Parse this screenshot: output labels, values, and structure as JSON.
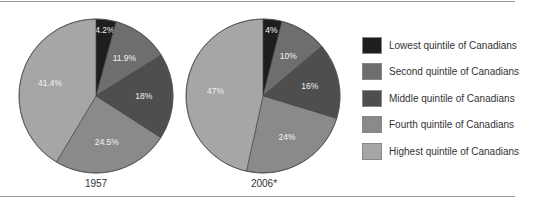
{
  "chart_data": [
    {
      "type": "pie",
      "title": "1957",
      "categories": [
        "Lowest quintile of Canadians",
        "Second quintile of Canadians",
        "Middle quintile of Canadians",
        "Fourth quintile of Canadians",
        "Highest quintile of Canadians"
      ],
      "values": [
        4.2,
        11.9,
        18,
        24.5,
        41.4
      ],
      "labels": [
        "4.2%",
        "11.9%",
        "18%",
        "24.5%",
        "41.4%"
      ]
    },
    {
      "type": "pie",
      "title": "2006*",
      "categories": [
        "Lowest quintile of Canadians",
        "Second quintile of Canadians",
        "Middle quintile of Canadians",
        "Fourth quintile of Canadians",
        "Highest quintile of Canadians"
      ],
      "values": [
        4,
        10,
        16,
        24,
        47
      ],
      "labels": [
        "4%",
        "10%",
        "16%",
        "24%",
        "47%"
      ]
    }
  ],
  "colors": [
    "#1e1e1e",
    "#6e6e6e",
    "#4e4e4e",
    "#8a8a8a",
    "#a6a6a6"
  ],
  "pies": {
    "p1_year": "1957",
    "p2_year": "2006*"
  },
  "legend": [
    {
      "label": "Lowest quintile of Canadians"
    },
    {
      "label": "Second quintile of Canadians"
    },
    {
      "label": "Middle quintile of Canadians"
    },
    {
      "label": "Fourth quintile of Canadians"
    },
    {
      "label": "Highest quintile of Canadians"
    }
  ]
}
